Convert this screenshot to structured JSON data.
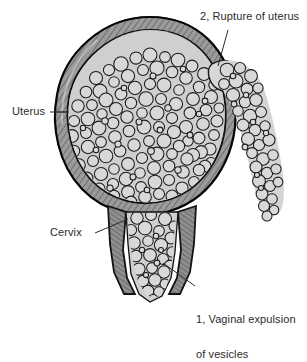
{
  "figure": {
    "background_color": "#ffffff",
    "line_color": "#1a1a1a",
    "text_color": "#2b2b2b",
    "wall_fill": "#9a9a9a",
    "vesicle_fill": "#d6d6d6",
    "cavity_fill": "#cfcfcf",
    "labels": {
      "uterus": "Uterus",
      "cervix": "Cervix",
      "rupture": "2, Rupture of uterus",
      "vaginal_expulsion_line1": "1, Vaginal expulsion",
      "vaginal_expulsion_line2": "of vesicles"
    },
    "structures": {
      "uterus_body": "uterine-body",
      "uterine_wall": "uterine-wall",
      "vesicle_mass": "vesicle-mass",
      "rupture_site": "rupture-site",
      "extruded_vesicles": "extruded-vesicle-stream",
      "cervical_canal": "cervical-canal",
      "vaginal_vesicles": "vaginal-vesicle-stream"
    }
  }
}
